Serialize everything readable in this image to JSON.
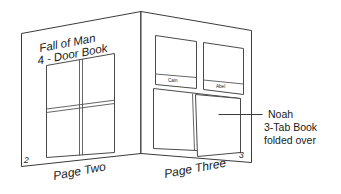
{
  "diagram": {
    "left_page": {
      "name": "Page Two",
      "page_number": "2",
      "project_title_line1": "Fall of Man",
      "project_title_line2": "4 - Door Book",
      "footer_label": "Page Two"
    },
    "right_page": {
      "name": "Page Three",
      "page_number": "3",
      "footer_label": "Page Three",
      "tab_cards": [
        {
          "label": "Cain"
        },
        {
          "label": "Abel"
        }
      ]
    },
    "annotation": {
      "line1": "Noah",
      "line2": "3-Tab Book",
      "line3": "folded over"
    },
    "colors": {
      "stroke": "#3b3b3b",
      "paper": "#ffffff",
      "text": "#1a1a1a",
      "tab_text": "#6a6a6a"
    }
  }
}
